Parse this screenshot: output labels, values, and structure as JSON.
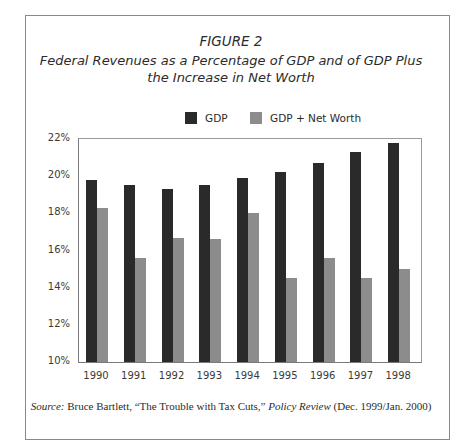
{
  "figure": {
    "label": "FIGURE 2",
    "title_line1": "Federal Revenues as a Percentage of GDP and of GDP Plus",
    "title_line2": "the Increase in Net Worth"
  },
  "legend": [
    {
      "label": "GDP",
      "color": "#2a2a2a"
    },
    {
      "label": "GDP + Net Worth",
      "color": "#8c8c8c"
    }
  ],
  "source": {
    "prefix": "Source:",
    "author": " Bruce Bartlett, “The Trouble with Tax Cuts,” ",
    "publication": "Policy Review",
    "date": " (Dec. 1999/Jan. 2000)"
  },
  "chart_data": {
    "type": "bar",
    "title": "Federal Revenues as a Percentage of GDP and of GDP Plus the Increase in Net Worth",
    "subtitle": "FIGURE 2",
    "xlabel": "",
    "ylabel": "",
    "categories": [
      "1990",
      "1991",
      "1992",
      "1993",
      "1994",
      "1995",
      "1996",
      "1997",
      "1998"
    ],
    "series": [
      {
        "name": "GDP",
        "color": "#2a2a2a",
        "values": [
          19.8,
          19.5,
          19.3,
          19.5,
          19.9,
          20.2,
          20.7,
          21.3,
          21.8
        ]
      },
      {
        "name": "GDP + Net Worth",
        "color": "#8c8c8c",
        "values": [
          18.3,
          15.6,
          16.7,
          16.6,
          18.0,
          14.5,
          15.6,
          14.5,
          15.0
        ]
      }
    ],
    "yticks": [
      "10%",
      "12%",
      "14%",
      "16%",
      "18%",
      "20%",
      "22%"
    ],
    "ylim": [
      10,
      22
    ],
    "grid": false,
    "legend_position": "top"
  }
}
